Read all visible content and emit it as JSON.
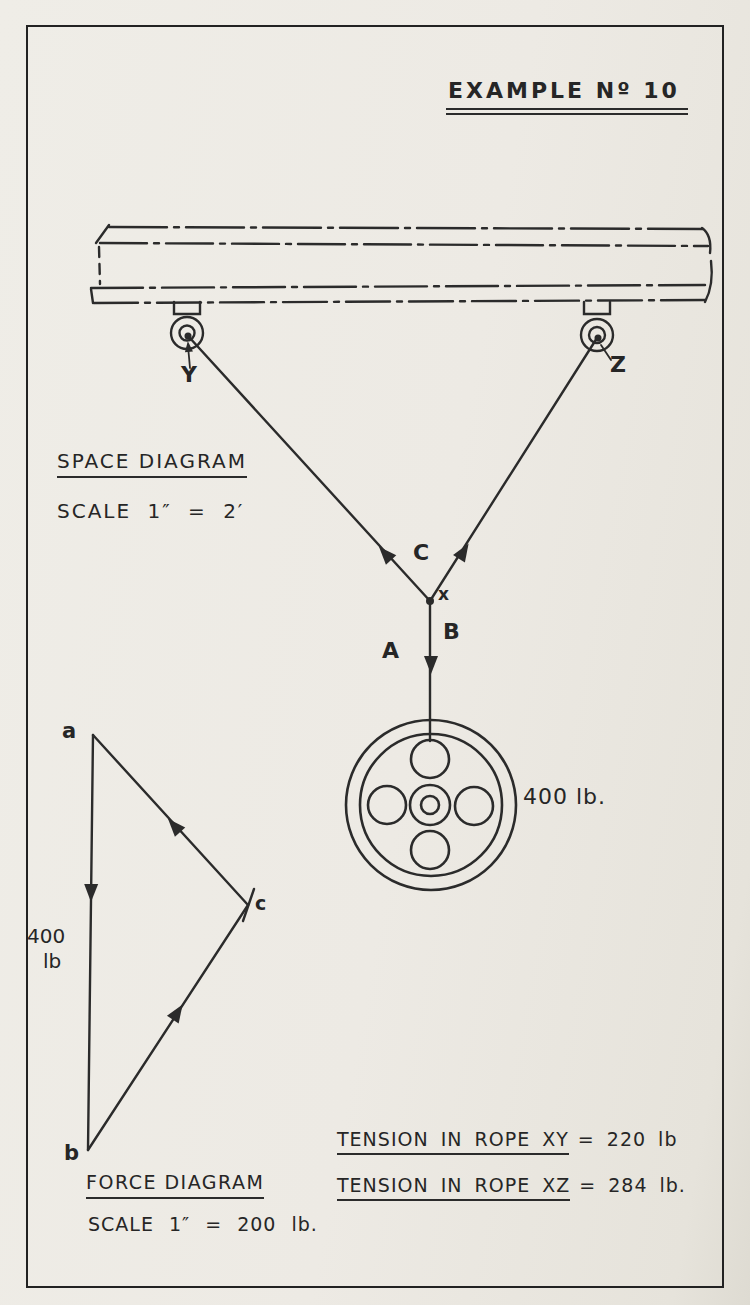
{
  "title": "EXAMPLE Nº 10",
  "space_diagram": {
    "heading": "SPACE DIAGRAM",
    "scale": "SCALE 1″ = 2′",
    "label_y": "Y",
    "label_z": "Z",
    "label_c": "C",
    "label_x": "x",
    "label_a": "A",
    "label_b": "B",
    "load_label": "400 lb."
  },
  "force_diagram": {
    "heading": "FORCE DIAGRAM",
    "scale": "SCALE 1″ = 200 lb.",
    "vertex_a": "a",
    "vertex_b": "b",
    "vertex_c": "c",
    "load_value": "400",
    "load_unit": "lb"
  },
  "results": [
    {
      "label": "TENSION IN ROPE XY",
      "value": "= 220 lb"
    },
    {
      "label": "TENSION IN ROPE XZ",
      "value": "= 284 lb."
    }
  ],
  "colors": {
    "ink": "#2b2b2b",
    "paper": "#edeae4"
  }
}
